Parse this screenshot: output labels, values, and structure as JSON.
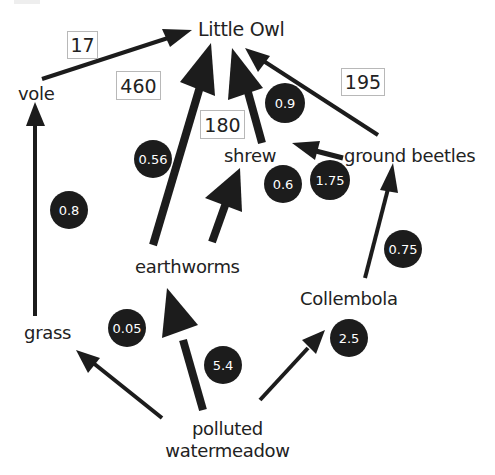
{
  "diagram": {
    "type": "food-web",
    "nodes": {
      "little_owl": "Little Owl",
      "vole": "vole",
      "shrew": "shrew",
      "ground_beetles": "ground beetles",
      "earthworms": "earthworms",
      "collembola": "Collembola",
      "grass": "grass",
      "source_line1": "polluted",
      "source_line2": "watermeadow"
    },
    "boxed_values": {
      "vole_to_owl": "17",
      "earthworms_to_owl": "460",
      "shrew_to_owl": "180",
      "beetles_to_owl": "195"
    },
    "circle_values": {
      "grass_to_vole": "0.8",
      "earthworms_to_owl": "0.56",
      "shrew_to_owl": "0.9",
      "earthworms_to_shrew": "0.6",
      "beetles_to_shrew": "1.75",
      "collembola_to_beetles": "0.75",
      "meadow_to_grass": "0.05",
      "meadow_to_earthworms": "5.4",
      "meadow_to_collembola": "2.5"
    },
    "edges": [
      {
        "from": "vole",
        "to": "Little Owl",
        "box": "17"
      },
      {
        "from": "earthworms",
        "to": "Little Owl",
        "box": "460",
        "circle": "0.56"
      },
      {
        "from": "shrew",
        "to": "Little Owl",
        "box": "180",
        "circle": "0.9"
      },
      {
        "from": "ground beetles",
        "to": "Little Owl",
        "box": "195"
      },
      {
        "from": "grass",
        "to": "vole",
        "circle": "0.8"
      },
      {
        "from": "earthworms",
        "to": "shrew",
        "circle": "0.6"
      },
      {
        "from": "ground beetles",
        "to": "shrew",
        "circle": "1.75"
      },
      {
        "from": "Collembola",
        "to": "ground beetles",
        "circle": "0.75"
      },
      {
        "from": "polluted watermeadow",
        "to": "grass",
        "circle": "0.05"
      },
      {
        "from": "polluted watermeadow",
        "to": "earthworms",
        "circle": "5.4"
      },
      {
        "from": "polluted watermeadow",
        "to": "Collembola",
        "circle": "2.5"
      }
    ],
    "colors": {
      "arrow": "#1c1c1c",
      "badge_fill": "#1c1c1c",
      "badge_text": "#ffffff",
      "box_border": "#b8b8b8",
      "label_text": "#222222"
    }
  }
}
